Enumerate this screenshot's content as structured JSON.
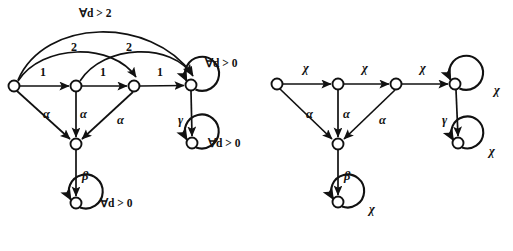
{
  "figure": {
    "background_color": "#ffffff",
    "stroke_color": "#111111"
  },
  "left_diagram": {
    "name": "left-automaton",
    "nodes": [
      {
        "id": "L0",
        "cx": 14,
        "cy": 86,
        "r": 5.5
      },
      {
        "id": "L1",
        "cx": 76,
        "cy": 86,
        "r": 5.5
      },
      {
        "id": "L2",
        "cx": 134,
        "cy": 86,
        "r": 5.5
      },
      {
        "id": "L3",
        "cx": 191,
        "cy": 85,
        "r": 5.5
      },
      {
        "id": "L4",
        "cx": 76,
        "cy": 144,
        "r": 5.5
      },
      {
        "id": "L5",
        "cx": 76,
        "cy": 203,
        "r": 5.5
      },
      {
        "id": "L6",
        "cx": 192,
        "cy": 143,
        "r": 5.5
      }
    ],
    "labels": [
      {
        "name": "edge-label-forall-d-gt-2",
        "text": "∀d > 2",
        "x": 79,
        "y": 8
      },
      {
        "name": "edge-label-2-first",
        "text": "2",
        "x": 71,
        "y": 41
      },
      {
        "name": "edge-label-2-second",
        "text": "2",
        "x": 126,
        "y": 41
      },
      {
        "name": "edge-label-1-first",
        "text": "1",
        "x": 40,
        "y": 66
      },
      {
        "name": "edge-label-1-second",
        "text": "1",
        "x": 100,
        "y": 66
      },
      {
        "name": "edge-label-1-third",
        "text": "1",
        "x": 157,
        "y": 66
      },
      {
        "name": "edge-label-alpha-first",
        "text": "α",
        "x": 43,
        "y": 108
      },
      {
        "name": "edge-label-alpha-second",
        "text": "α",
        "x": 80,
        "y": 108
      },
      {
        "name": "edge-label-alpha-third",
        "text": "α",
        "x": 117,
        "y": 114
      },
      {
        "name": "edge-label-beta",
        "text": "β",
        "x": 82,
        "y": 170
      },
      {
        "name": "edge-label-gamma",
        "text": "γ",
        "x": 178,
        "y": 114
      },
      {
        "name": "loop-label-forall-top",
        "text": "∀d > 0",
        "x": 205,
        "y": 58
      },
      {
        "name": "loop-label-forall-mid",
        "text": "∀d > 0",
        "x": 208,
        "y": 138
      },
      {
        "name": "loop-label-forall-bottom",
        "text": "∀d > 0",
        "x": 100,
        "y": 198
      }
    ]
  },
  "right_diagram": {
    "name": "right-automaton",
    "nodes": [
      {
        "id": "R0",
        "cx": 277,
        "cy": 84,
        "r": 5.5
      },
      {
        "id": "R1",
        "cx": 338,
        "cy": 84,
        "r": 5.5
      },
      {
        "id": "R2",
        "cx": 396,
        "cy": 84,
        "r": 5.5
      },
      {
        "id": "R3",
        "cx": 455,
        "cy": 84,
        "r": 5.5
      },
      {
        "id": "R4",
        "cx": 338,
        "cy": 144,
        "r": 5.5
      },
      {
        "id": "R5",
        "cx": 338,
        "cy": 202,
        "r": 5.5
      },
      {
        "id": "R6",
        "cx": 458,
        "cy": 143,
        "r": 5.5
      }
    ],
    "labels": [
      {
        "name": "edge-label-chi-first",
        "text": "χ",
        "x": 303,
        "y": 62
      },
      {
        "name": "edge-label-chi-second",
        "text": "χ",
        "x": 362,
        "y": 62
      },
      {
        "name": "edge-label-chi-third",
        "text": "χ",
        "x": 420,
        "y": 62
      },
      {
        "name": "edge-label-alpha-first",
        "text": "α",
        "x": 306,
        "y": 108
      },
      {
        "name": "edge-label-alpha-second",
        "text": "α",
        "x": 343,
        "y": 108
      },
      {
        "name": "edge-label-alpha-third",
        "text": "α",
        "x": 379,
        "y": 114
      },
      {
        "name": "edge-label-beta",
        "text": "β",
        "x": 344,
        "y": 170
      },
      {
        "name": "edge-label-gamma",
        "text": "γ",
        "x": 442,
        "y": 114
      },
      {
        "name": "loop-label-chi-top",
        "text": "χ",
        "x": 494,
        "y": 84
      },
      {
        "name": "loop-label-chi-mid",
        "text": "χ",
        "x": 489,
        "y": 145
      },
      {
        "name": "loop-label-chi-bottom",
        "text": "χ",
        "x": 369,
        "y": 203
      }
    ]
  }
}
